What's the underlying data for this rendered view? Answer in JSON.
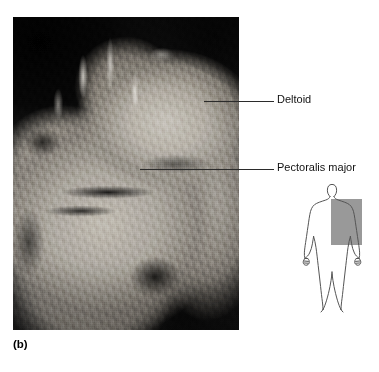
{
  "figure": {
    "caption": "(b)",
    "photograph": {
      "name": "cadaver-dissection-photo",
      "subject": "anterior chest and shoulder dissection"
    }
  },
  "callouts": [
    {
      "id": "deltoid",
      "label": "Deltoid",
      "label_x": 277,
      "label_y": 93,
      "leader_x": 204,
      "leader_y": 101,
      "leader_width": 70
    },
    {
      "id": "pectoralis-major",
      "label": "Pectoralis major",
      "label_x": 277,
      "label_y": 161,
      "leader_x": 140,
      "leader_y": 169,
      "leader_width": 134
    }
  ],
  "body_diagram": {
    "name": "body-orientation-diagram",
    "description": "anterior human body outline",
    "highlight": {
      "name": "region-highlight",
      "color": "#999999",
      "x": 43,
      "y": 19,
      "width": 31,
      "height": 46
    },
    "outline_color": "#555555"
  },
  "colors": {
    "background": "#ffffff",
    "text": "#111111",
    "leader_line": "#2b2b2b",
    "highlight_gray": "#999999"
  }
}
